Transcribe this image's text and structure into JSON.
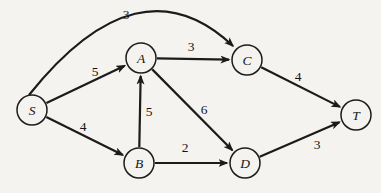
{
  "figure": {
    "width": 381,
    "height": 193,
    "background_color": "#f4f3f0",
    "ink_color": "#1b1b1b",
    "node_radius": 15
  },
  "graph": {
    "nodes": [
      {
        "id": "S",
        "label": "S",
        "x": 32,
        "y": 110
      },
      {
        "id": "A",
        "label": "A",
        "x": 141,
        "y": 58
      },
      {
        "id": "B",
        "label": "B",
        "x": 139,
        "y": 163
      },
      {
        "id": "C",
        "label": "C",
        "x": 247,
        "y": 60
      },
      {
        "id": "D",
        "label": "D",
        "x": 245,
        "y": 163
      },
      {
        "id": "T",
        "label": "T",
        "x": 356,
        "y": 115
      }
    ],
    "edges": [
      {
        "from": "S",
        "to": "C",
        "weight": "3",
        "curve": {
          "start": [
            29,
            95
          ],
          "control": [
            139,
            -43
          ],
          "end": [
            233,
            46
          ]
        },
        "label_pos": [
          126,
          14
        ]
      },
      {
        "from": "S",
        "to": "A",
        "weight": "5",
        "label_pos": [
          95,
          71
        ]
      },
      {
        "from": "S",
        "to": "B",
        "weight": "4",
        "label_pos": [
          83,
          126
        ]
      },
      {
        "from": "B",
        "to": "A",
        "weight": "5",
        "label_pos": [
          149,
          111
        ]
      },
      {
        "from": "A",
        "to": "C",
        "weight": "3",
        "label_pos": [
          191,
          46
        ]
      },
      {
        "from": "A",
        "to": "D",
        "weight": "6",
        "label_pos": [
          204,
          109
        ]
      },
      {
        "from": "B",
        "to": "D",
        "weight": "2",
        "label_pos": [
          185,
          147
        ]
      },
      {
        "from": "C",
        "to": "T",
        "weight": "4",
        "label_pos": [
          298,
          76
        ]
      },
      {
        "from": "D",
        "to": "T",
        "weight": "3",
        "label_pos": [
          317,
          144
        ]
      }
    ]
  }
}
